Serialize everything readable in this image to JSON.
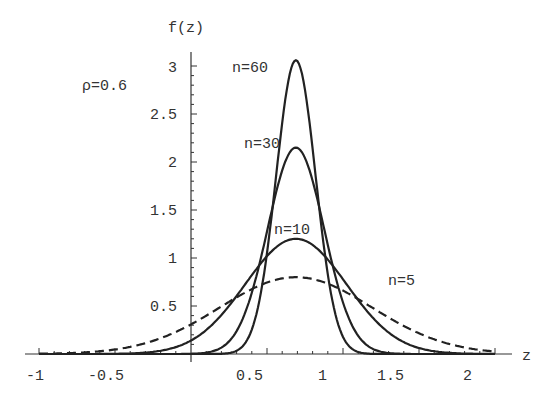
{
  "chart_data": {
    "type": "line",
    "title": "",
    "xlabel": "z",
    "ylabel": "f(z)",
    "xlim": [
      -1,
      2
    ],
    "ylim": [
      0,
      3.1
    ],
    "grid": false,
    "legend": "none (inline curve labels)",
    "annotation": "ρ=0.6",
    "x_ticks": [
      {
        "value": -1,
        "label": "-1"
      },
      {
        "value": -0.5,
        "label": "-0.5"
      },
      {
        "value": 0.5,
        "label": "0.5"
      },
      {
        "value": 1,
        "label": "1"
      },
      {
        "value": 1.5,
        "label": "1.5"
      },
      {
        "value": 2,
        "label": "2"
      }
    ],
    "y_ticks": [
      {
        "value": 0.5,
        "label": "0.5"
      },
      {
        "value": 1,
        "label": "1"
      },
      {
        "value": 1.5,
        "label": "1.5"
      },
      {
        "value": 2,
        "label": "2"
      },
      {
        "value": 2.5,
        "label": "2.5"
      },
      {
        "value": 3,
        "label": "3"
      }
    ],
    "series": [
      {
        "name": "n=60",
        "style": "solid",
        "mean": 0.69,
        "peak": 3.06,
        "sd": 0.13,
        "x": [
          0.3,
          0.5,
          0.6,
          0.69,
          0.8,
          0.9,
          1.1
        ],
        "y": [
          0.03,
          0.6,
          2.36,
          3.06,
          2.14,
          0.84,
          0.02
        ],
        "label_pos": {
          "z": 0.25,
          "f": 3.0
        }
      },
      {
        "name": "n=30",
        "style": "solid",
        "mean": 0.69,
        "peak": 2.15,
        "sd": 0.186,
        "x": [
          0.2,
          0.4,
          0.55,
          0.69,
          0.85,
          1.0,
          1.3
        ],
        "y": [
          0.07,
          0.56,
          1.62,
          2.15,
          1.49,
          0.53,
          0.01
        ],
        "label_pos": {
          "z": 0.17,
          "f": 2.15
        }
      },
      {
        "name": "n=10",
        "style": "solid",
        "mean": 0.69,
        "peak": 1.2,
        "sd": 0.333,
        "x": [
          -0.5,
          0,
          0.3,
          0.69,
          1.0,
          1.3,
          1.6
        ],
        "y": [
          0.0,
          0.14,
          0.6,
          1.2,
          0.78,
          0.23,
          0.03
        ],
        "label_pos": {
          "z": 0.55,
          "f": 1.28
        }
      },
      {
        "name": "n=5",
        "style": "dashed",
        "mean": 0.69,
        "peak": 0.8,
        "sd": 0.5,
        "x": [
          -1,
          -0.5,
          0,
          0.69,
          1.2,
          1.5,
          2.0
        ],
        "y": [
          0.0,
          0.05,
          0.31,
          0.8,
          0.47,
          0.21,
          0.02
        ],
        "label_pos": {
          "z": 1.27,
          "f": 0.62
        }
      }
    ]
  },
  "labels": {
    "y_axis_title": "f(z)",
    "x_axis_title": "z",
    "rho": "ρ=0.6",
    "n60": "n=60",
    "n30": "n=30",
    "n10": "n=10",
    "n5": "n=5",
    "xt0": "-1",
    "xt1": "-0.5",
    "xt2": "0.5",
    "xt3": "1",
    "xt4": "1.5",
    "xt5": "2",
    "yt0": "0.5",
    "yt1": "1",
    "yt2": "1.5",
    "yt3": "2",
    "yt4": "2.5",
    "yt5": "3"
  }
}
